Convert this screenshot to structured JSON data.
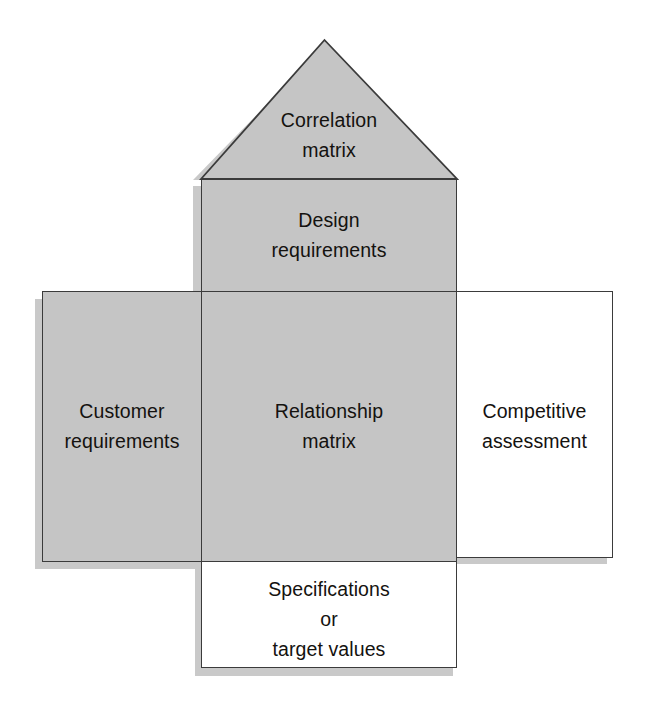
{
  "diagram": {
    "colors": {
      "fill_gray": "#c5c5c5",
      "fill_white": "#ffffff",
      "stroke": "#3b3b3b",
      "shadow": "#c9c9c9",
      "text": "#14120f",
      "background": "#ffffff"
    },
    "rooms": [
      {
        "id": "correlation-matrix",
        "label": "Correlation\nmatrix",
        "shape": "triangle",
        "fill": "gray"
      },
      {
        "id": "design-requirements",
        "label": "Design\nrequirements",
        "shape": "rectangle",
        "fill": "gray"
      },
      {
        "id": "customer-requirements",
        "label": "Customer\nrequirements",
        "shape": "rectangle",
        "fill": "gray"
      },
      {
        "id": "relationship-matrix",
        "label": "Relationship\nmatrix",
        "shape": "rectangle",
        "fill": "gray"
      },
      {
        "id": "competitive-assessment",
        "label": "Competitive\nassessment",
        "shape": "rectangle",
        "fill": "white"
      },
      {
        "id": "specifications",
        "label": "Specifications\nor\ntarget values",
        "shape": "rectangle",
        "fill": "white"
      }
    ]
  }
}
